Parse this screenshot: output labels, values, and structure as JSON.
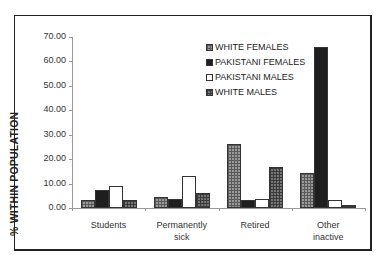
{
  "chart_data": {
    "type": "bar",
    "title": "",
    "xlabel": "",
    "ylabel": "% WITHIN POPULATION",
    "ylim": [
      0,
      70
    ],
    "yticks": [
      "0.00",
      "10.00",
      "20.00",
      "30.00",
      "40.00",
      "50.00",
      "60.00",
      "70.00"
    ],
    "grid": false,
    "legend_position": "upper-center-right",
    "categories": [
      "Students",
      "Permanently sick",
      "Retired",
      "Other inactive"
    ],
    "category_labels": [
      [
        "Students"
      ],
      [
        "Permanently",
        "sick"
      ],
      [
        "Retired"
      ],
      [
        "Other",
        "inactive"
      ]
    ],
    "series": [
      {
        "name": "WHITE FEMALES",
        "values": [
          3.2,
          4.7,
          26.2,
          14.5
        ]
      },
      {
        "name": "PAKISTANI FEMALES",
        "values": [
          7.2,
          3.8,
          3.2,
          66.0
        ]
      },
      {
        "name": "PAKISTANI MALES",
        "values": [
          9.2,
          12.9,
          3.6,
          3.2
        ]
      },
      {
        "name": "WHITE MALES",
        "values": [
          3.4,
          6.1,
          16.9,
          1.2
        ]
      }
    ]
  }
}
